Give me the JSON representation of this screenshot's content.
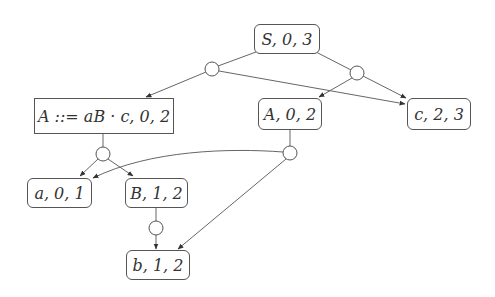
{
  "diagram": {
    "title": "",
    "type": "parse forest / SPPF graph",
    "nodes": [
      {
        "id": "S03",
        "label": "S, 0, 3",
        "shape": "rounded",
        "x": 254,
        "y": 24,
        "w": 66,
        "h": 30
      },
      {
        "id": "Aitem",
        "label": "A ::= aB · c, 0, 2",
        "shape": "square",
        "x": 34,
        "y": 98,
        "w": 140,
        "h": 36
      },
      {
        "id": "A02",
        "label": "A, 0, 2",
        "shape": "rounded",
        "x": 258,
        "y": 98,
        "w": 64,
        "h": 32
      },
      {
        "id": "c23",
        "label": "c, 2, 3",
        "shape": "rounded",
        "x": 407,
        "y": 98,
        "w": 64,
        "h": 32
      },
      {
        "id": "a01",
        "label": "a, 0, 1",
        "shape": "rounded",
        "x": 27,
        "y": 178,
        "w": 65,
        "h": 30
      },
      {
        "id": "B12",
        "label": "B, 1, 2",
        "shape": "rounded",
        "x": 125,
        "y": 178,
        "w": 63,
        "h": 30
      },
      {
        "id": "b12",
        "label": "b, 1, 2",
        "shape": "rounded",
        "x": 126,
        "y": 250,
        "w": 64,
        "h": 30
      }
    ],
    "packed_nodes": [
      {
        "id": "p1",
        "cx": 212,
        "cy": 69,
        "r": 7
      },
      {
        "id": "p2",
        "cx": 357,
        "cy": 73,
        "r": 7
      },
      {
        "id": "p3",
        "cx": 103,
        "cy": 154,
        "r": 7
      },
      {
        "id": "p4",
        "cx": 290,
        "cy": 153,
        "r": 7
      },
      {
        "id": "p5",
        "cx": 156,
        "cy": 228,
        "r": 7
      }
    ],
    "edges": [
      {
        "from": "S03",
        "to": "p1",
        "arrow": false
      },
      {
        "from": "S03",
        "to": "p2",
        "arrow": false
      },
      {
        "from": "p1",
        "to": "Aitem",
        "arrow": true
      },
      {
        "from": "p1",
        "to": "c23",
        "arrow": true
      },
      {
        "from": "p2",
        "to": "A02",
        "arrow": true
      },
      {
        "from": "p2",
        "to": "c23",
        "arrow": true
      },
      {
        "from": "Aitem",
        "to": "p3",
        "arrow": false
      },
      {
        "from": "p3",
        "to": "a01",
        "arrow": true
      },
      {
        "from": "p3",
        "to": "B12",
        "arrow": true
      },
      {
        "from": "A02",
        "to": "p4",
        "arrow": false
      },
      {
        "from": "p4",
        "to": "a01",
        "arrow": true,
        "curved": true
      },
      {
        "from": "p4",
        "to": "b12",
        "arrow": true
      },
      {
        "from": "B12",
        "to": "p5",
        "arrow": false
      },
      {
        "from": "p5",
        "to": "b12",
        "arrow": true
      }
    ],
    "colors": {
      "stroke": "#555555",
      "text": "#333333",
      "background": "#ffffff"
    }
  }
}
